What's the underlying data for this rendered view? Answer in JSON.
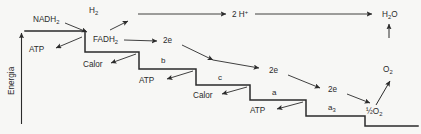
{
  "figure": {
    "domain": "diagram",
    "language": "pt",
    "background_color": "#f7f7f5",
    "line_color": "#2b2b2b",
    "text_color": "#2b2b2b"
  },
  "axis": {
    "label": "Energia",
    "orientation": "vertical",
    "arrow_direction": "up"
  },
  "donors": {
    "nadh": {
      "base": "NADH",
      "sub": "2"
    },
    "fadh": {
      "base": "FADH",
      "sub": "2"
    },
    "hydrogen": {
      "base": "H",
      "sub": "2"
    }
  },
  "top_pathway": {
    "protons": {
      "base": "2 H",
      "sup": "+"
    },
    "water": {
      "pre": "H",
      "sub": "2",
      "post": "O"
    }
  },
  "oxygen_pathway": {
    "oxygen": {
      "base": "O",
      "sub": "2"
    },
    "half_oxygen": {
      "frac": "½",
      "base": "O",
      "sub": "2"
    }
  },
  "electron_labels": [
    {
      "text": "2e"
    },
    {
      "text": "2e"
    },
    {
      "text": "2e"
    },
    {
      "text": "2e"
    }
  ],
  "carriers": [
    {
      "name": "b",
      "sub": ""
    },
    {
      "name": "c",
      "sub": ""
    },
    {
      "name": "a",
      "sub": ""
    },
    {
      "name": "a",
      "sub": "3"
    }
  ],
  "outputs": [
    {
      "label": "ATP",
      "kind": "atp"
    },
    {
      "label": "Calor",
      "kind": "heat"
    },
    {
      "label": "ATP",
      "kind": "atp"
    },
    {
      "label": "Calor",
      "kind": "heat"
    },
    {
      "label": "ATP",
      "kind": "atp"
    }
  ],
  "staircase": {
    "description": "descending energy steps",
    "steps": 6
  }
}
